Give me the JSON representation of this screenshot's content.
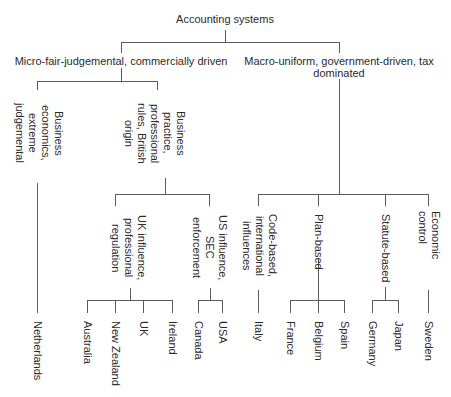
{
  "diagram": {
    "title": "Accounting systems",
    "left_branch": {
      "label": "Micro-fair-judgemental, commercially driven",
      "children": [
        {
          "lines": [
            "Business",
            "economics,",
            "extreme",
            "judgemental"
          ],
          "leaves": [
            "Netherlands"
          ]
        },
        {
          "lines": [
            "Business",
            "practice,",
            "professional",
            "rules, British",
            "origin"
          ],
          "children": [
            {
              "lines": [
                "UK influence,",
                "professional",
                "regulation"
              ],
              "leaves": [
                "Australia",
                "New Zealand",
                "UK",
                "Ireland"
              ]
            },
            {
              "lines": [
                "US influence,",
                "SEC",
                "enforcement"
              ],
              "leaves": [
                "Canada",
                "USA"
              ]
            }
          ]
        }
      ]
    },
    "right_branch": {
      "label_line1": "Macro-uniform, government-driven, tax",
      "label_line2": "dominated",
      "children": [
        {
          "lines": [
            "Code-based,",
            "international",
            "influences"
          ],
          "leaves": [
            "Italy"
          ]
        },
        {
          "lines": [
            "Plan-based"
          ],
          "leaves": [
            "France",
            "Belgium",
            "Spain"
          ]
        },
        {
          "lines": [
            "Statute-based"
          ],
          "leaves": [
            "Germany",
            "Japan"
          ]
        },
        {
          "lines": [
            "Economic",
            "control"
          ],
          "leaves": [
            "Sweden"
          ]
        }
      ]
    }
  }
}
